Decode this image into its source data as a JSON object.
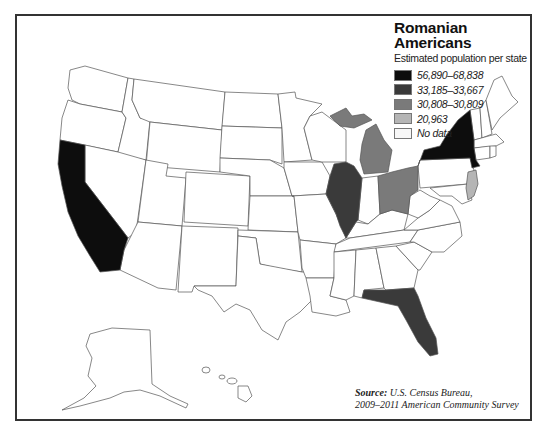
{
  "legend": {
    "title_line1": "Romanian",
    "title_line2": "Americans",
    "subtitle": "Estimated population per state",
    "items": [
      {
        "label": "56,890–68,838",
        "color": "#0d0d0d"
      },
      {
        "label": "33,185–33,667",
        "color": "#3a3a3a"
      },
      {
        "label": "30,808–30,809",
        "color": "#7a7a7a"
      },
      {
        "label": "20,963",
        "color": "#b5b5b5"
      },
      {
        "label": "No data",
        "color": "#f7f7f7"
      }
    ]
  },
  "source": {
    "label": "Source:",
    "line1": "U.S. Census Bureau,",
    "line2": "2009–2011 American Community Survey"
  },
  "states": {
    "California": {
      "tier": "56,890–68,838",
      "color": "#0d0d0d"
    },
    "New York": {
      "tier": "56,890–68,838",
      "color": "#0d0d0d"
    },
    "Illinois": {
      "tier": "33,185–33,667",
      "color": "#3a3a3a"
    },
    "Florida": {
      "tier": "33,185–33,667",
      "color": "#3a3a3a"
    },
    "Michigan": {
      "tier": "30,808–30,809",
      "color": "#7a7a7a"
    },
    "Ohio": {
      "tier": "30,808–30,809",
      "color": "#7a7a7a"
    },
    "New Jersey": {
      "tier": "20,963",
      "color": "#b5b5b5"
    },
    "Other states": {
      "tier": "No data",
      "color": "#f7f7f7"
    }
  }
}
